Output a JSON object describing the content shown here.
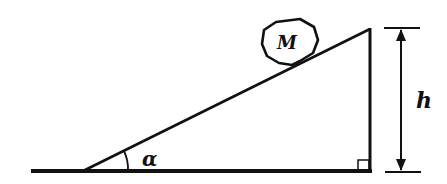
{
  "diagram": {
    "title": "",
    "object_label": "M",
    "angle_label": "α",
    "height_label": "h",
    "colors": {
      "stroke": "#111111",
      "background": "#ffffff"
    }
  }
}
